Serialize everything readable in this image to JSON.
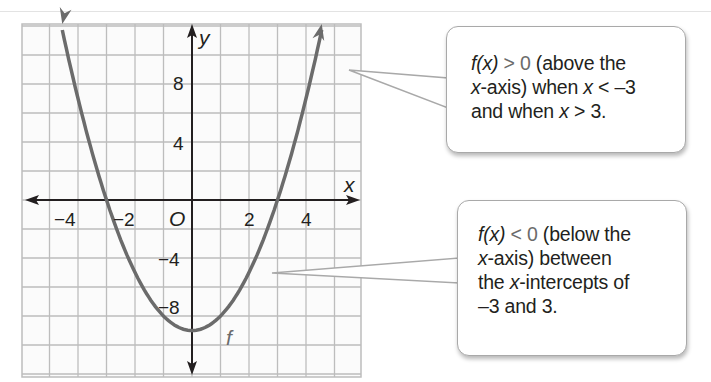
{
  "chart_data": {
    "type": "line",
    "title": "",
    "function": "f(x) = x^2 - 9",
    "series": [
      {
        "name": "f",
        "x": [
          -5,
          -4,
          -3,
          -2,
          -1,
          0,
          1,
          2,
          3,
          4,
          5
        ],
        "y": [
          16,
          7,
          0,
          -5,
          -8,
          -9,
          -8,
          -5,
          0,
          7,
          16
        ]
      }
    ],
    "xlabel": "x",
    "ylabel": "y",
    "origin_label": "O",
    "x_tick_labels": [
      "-4",
      "-2",
      "2",
      "4"
    ],
    "y_tick_labels": [
      "8",
      "4",
      "-4",
      "-8"
    ],
    "x_ticks": [
      -4,
      -2,
      2,
      4
    ],
    "y_ticks": [
      8,
      4,
      -4,
      -8
    ],
    "xlim": [
      -6,
      6
    ],
    "ylim": [
      -12,
      12
    ],
    "grid": true,
    "grid_step": {
      "x": 1,
      "y": 2
    },
    "x_intercepts": [
      -3,
      3
    ],
    "vertex": [
      0,
      -9
    ],
    "curve_label": "f",
    "annotations": [
      "f(x) > 0 (above the x-axis) when x < -3 and when x > 3.",
      "f(x) < 0 (below the x-axis) between the x-intercepts of -3 and 3."
    ]
  },
  "colors": {
    "curve": "#6b6b6b",
    "axes": "#231f20",
    "grid": "#bdbdbd",
    "callout_border": "#a9a9a9",
    "text": "#231f20"
  },
  "graph": {
    "x_axis_label": "x",
    "y_axis_label": "y",
    "origin": "O",
    "curve_label": "f",
    "ticks_x": [
      "−4",
      "−2",
      "2",
      "4"
    ],
    "ticks_y": [
      "8",
      "4",
      "−4",
      "−8"
    ]
  },
  "callouts": [
    {
      "lines": [
        {
          "fx": "f(x)",
          "rel": " > 0",
          "rest": " (above the"
        },
        {
          "pre": "",
          "var": "x",
          "text": "-axis) when ",
          "var2": "x",
          "text2": " < –3"
        },
        {
          "text": "and when ",
          "var": "x",
          "text2": " > 3."
        }
      ]
    },
    {
      "lines": [
        {
          "fx": "f(x)",
          "rel": " < 0",
          "rest": " (below the"
        },
        {
          "var": "x",
          "text": "-axis) between"
        },
        {
          "text": "the ",
          "var": "x",
          "text2": "-intercepts of"
        },
        {
          "text": "–3 and 3."
        }
      ]
    }
  ]
}
